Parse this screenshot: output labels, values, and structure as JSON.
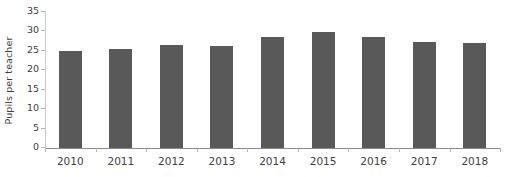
{
  "chart_data": {
    "type": "bar",
    "title": "",
    "xlabel": "",
    "ylabel": "Pupils per teacher",
    "categories": [
      "2010",
      "2011",
      "2012",
      "2013",
      "2014",
      "2015",
      "2016",
      "2017",
      "2018"
    ],
    "values": [
      25.0,
      25.6,
      26.4,
      26.3,
      28.5,
      29.8,
      28.5,
      27.3,
      27.0
    ],
    "ylim": [
      0,
      35
    ],
    "yticks": [
      0,
      5,
      10,
      15,
      20,
      25,
      30,
      35
    ],
    "ytick_labels": [
      "0",
      "5",
      "10",
      "15",
      "20",
      "25",
      "30",
      "35"
    ],
    "grid": false,
    "legend": null,
    "series_color": "#595959",
    "axis_color": "#8a8a8a",
    "text_color": "#3d3d3d"
  }
}
